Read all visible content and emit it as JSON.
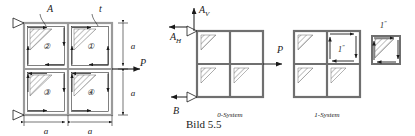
{
  "figure": {
    "caption": "Bild 5.5",
    "colors": {
      "line": "#1a1a1a",
      "plate_edge": "#8c8c8c",
      "hatch": "#5a5a5a",
      "background": "#ffffff"
    }
  },
  "panel_left": {
    "name": "shear-field-panel",
    "labels": {
      "area_label": "A",
      "thickness_label": "t",
      "force_label": "P",
      "dim_right_top": "a",
      "dim_right_bottom": "a",
      "dim_bottom_left": "a",
      "dim_bottom_right": "a"
    },
    "cells": [
      {
        "id": "cell-2",
        "label": "②",
        "position": "top-left"
      },
      {
        "id": "cell-1",
        "label": "①",
        "position": "top-right"
      },
      {
        "id": "cell-3",
        "label": "③",
        "position": "bottom-left"
      },
      {
        "id": "cell-4",
        "label": "④",
        "position": "bottom-right"
      }
    ]
  },
  "panel_middle": {
    "name": "zero-system-panel",
    "title": "0-System",
    "labels": {
      "reaction_vertical": "A",
      "reaction_vertical_sub": "V",
      "reaction_horizontal": "A",
      "reaction_horizontal_sub": "H",
      "reaction_b": "B",
      "load": "P"
    }
  },
  "panel_right": {
    "name": "one-system-panel",
    "title": "1-System",
    "labels": {
      "unit_force_inner": "1",
      "unit_force_outer": "1"
    }
  }
}
